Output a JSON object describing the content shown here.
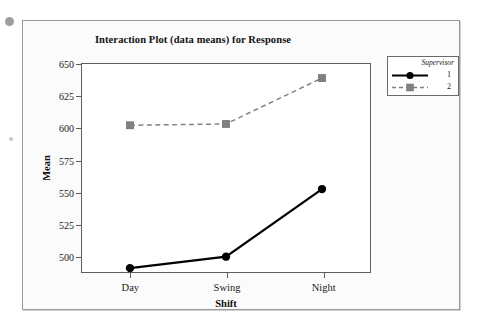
{
  "artifacts": {
    "speck_top_left": "gray-dot"
  },
  "chart_data": {
    "type": "line",
    "title": "Interaction Plot (data means) for Response",
    "xlabel": "Shift",
    "ylabel": "Mean",
    "categories": [
      "Day",
      "Swing",
      "Night"
    ],
    "ytick_labels": [
      "650",
      "625",
      "600",
      "575",
      "550",
      "525",
      "500"
    ],
    "yticks": [
      650,
      625,
      600,
      575,
      550,
      525,
      500
    ],
    "ylim": [
      487,
      650
    ],
    "grid": false,
    "legend_position": "outside-right-top",
    "legend_title": "Supervisor",
    "series": [
      {
        "name": "1",
        "values": [
          490,
          499,
          552
        ],
        "color": "#000000",
        "linestyle": "solid",
        "marker": "circle"
      },
      {
        "name": "2",
        "values": [
          602,
          603,
          639
        ],
        "color": "#808080",
        "linestyle": "dashed",
        "marker": "square"
      }
    ]
  }
}
